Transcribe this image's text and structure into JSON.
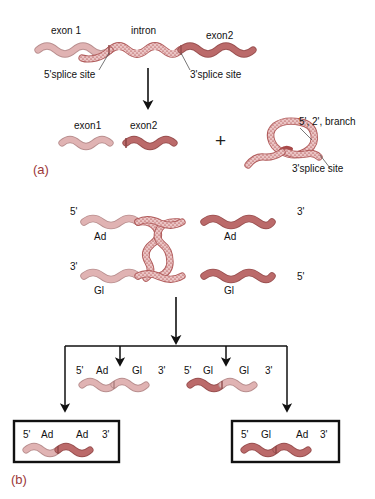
{
  "figure": {
    "title_hidden": "RNA splicing and trans-splicing diagram",
    "colors": {
      "exon_light": "#e0b3b3",
      "exon_light_edge": "#b98f8f",
      "exon_dark": "#bb6a6a",
      "exon_dark_edge": "#9a5151",
      "intron_fill": "#f0cccc",
      "intron_stipple": "#b05a5a",
      "panel_label": "#9c3838",
      "line": "#111111",
      "background": "#ffffff"
    }
  },
  "panel_a": {
    "label": "(a)",
    "precursor": {
      "exon1_label": "exon 1",
      "intron_label": "intron",
      "exon2_label": "exon2",
      "five_prime_splice_site": "5'splice site",
      "three_prime_splice_site": "3'splice site"
    },
    "products": {
      "spliced_exon1_label": "exon1",
      "spliced_exon2_label": "exon2",
      "plus_sign": "+",
      "lariat_branch_label": "5', 2', branch",
      "lariat_three_prime_label": "3'splice site"
    }
  },
  "panel_b": {
    "label": "(b)",
    "substrate": {
      "top_strand": {
        "left_end": "5'",
        "right_end": "3'",
        "left_gene": "Ad",
        "right_gene": "Ad"
      },
      "bottom_strand": {
        "left_end": "3'",
        "right_end": "5'",
        "left_gene": "Gl",
        "right_gene": "Gl"
      }
    },
    "intermediates": [
      {
        "five_prime": "5'",
        "first_gene": "Ad",
        "second_gene": "Gl",
        "three_prime": "3'",
        "first_shade": "light",
        "second_shade": "light"
      },
      {
        "five_prime": "5'",
        "first_gene": "Gl",
        "second_gene": "Gl",
        "three_prime": "3'",
        "first_shade": "dark",
        "second_shade": "light"
      }
    ],
    "boxed_products": [
      {
        "five_prime": "5'",
        "first_gene": "Ad",
        "second_gene": "Ad",
        "three_prime": "3'",
        "first_shade": "light",
        "second_shade": "dark"
      },
      {
        "five_prime": "5'",
        "first_gene": "Gl",
        "second_gene": "Ad",
        "three_prime": "3'",
        "first_shade": "dark",
        "second_shade": "dark"
      }
    ]
  }
}
